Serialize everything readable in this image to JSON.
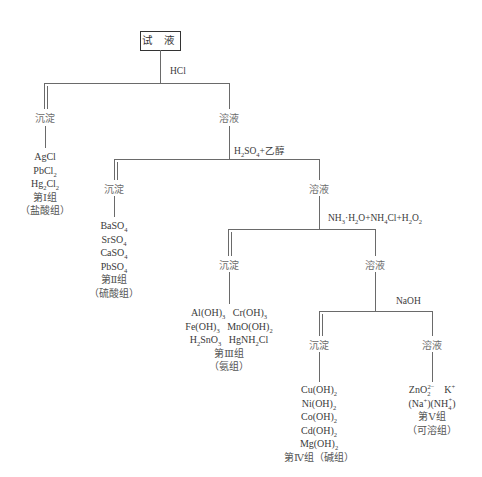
{
  "root": {
    "label": "试 液"
  },
  "steps": [
    {
      "reagent": "HCl",
      "precipitate_label": "沉淀",
      "solution_label": "溶液",
      "group": {
        "species": [
          "AgCl",
          "PbCl2",
          "Hg2Cl2"
        ],
        "group_name": "第Ⅰ组",
        "group_alias": "（盐酸组）"
      }
    },
    {
      "reagent": "H2SO4+乙醇",
      "precipitate_label": "沉淀",
      "solution_label": "溶液",
      "group": {
        "species": [
          "BaSO4",
          "SrSO4",
          "CaSO4",
          "PbSO4"
        ],
        "group_name": "第Ⅱ组",
        "group_alias": "（硫酸组）"
      }
    },
    {
      "reagent": "NH3·H2O+NH4Cl+H2O2",
      "precipitate_label": "沉淀",
      "solution_label": "溶液",
      "group": {
        "species": [
          "Al(OH)3  Cr(OH)3",
          "Fe(OH)3  MnO(OH)2",
          "H2SnO3  HgNH2Cl"
        ],
        "group_name": "第Ⅲ组",
        "group_alias": "（氨组）"
      }
    },
    {
      "reagent": "NaOH",
      "precipitate_label": "沉淀",
      "solution_label": "溶液",
      "group": {
        "species": [
          "Cu(OH)2",
          "Ni(OH)2",
          "Co(OH)2",
          "Cd(OH)2",
          "Mg(OH)2"
        ],
        "group_name": "第Ⅳ组（碱组）"
      },
      "final_solution": {
        "species": [
          "ZnO2 2-  K+",
          "(Na+)(NH4+)"
        ],
        "group_name": "第Ⅴ组",
        "group_alias": "（可溶组）"
      }
    }
  ]
}
